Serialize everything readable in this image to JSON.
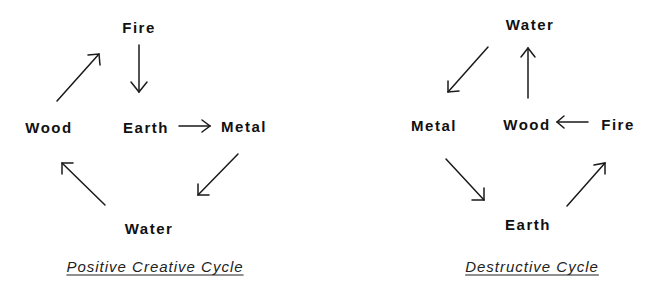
{
  "creative_cycle": {
    "caption": "Positive Creative Cycle",
    "nodes": {
      "fire": "Fire",
      "earth": "Earth",
      "metal": "Metal",
      "water": "Water",
      "wood": "Wood"
    },
    "edges": [
      {
        "from": "Fire",
        "to": "Earth"
      },
      {
        "from": "Earth",
        "to": "Metal"
      },
      {
        "from": "Metal",
        "to": "Water"
      },
      {
        "from": "Water",
        "to": "Wood"
      },
      {
        "from": "Wood",
        "to": "Fire"
      }
    ]
  },
  "destructive_cycle": {
    "caption": "Destructive Cycle",
    "nodes": {
      "water": "Water",
      "metal": "Metal",
      "wood": "Wood",
      "fire": "Fire",
      "earth": "Earth"
    },
    "edges": [
      {
        "from": "Water",
        "to": "Metal"
      },
      {
        "from": "Metal",
        "to": "Earth"
      },
      {
        "from": "Earth",
        "to": "Fire"
      },
      {
        "from": "Fire",
        "to": "Wood"
      },
      {
        "from": "Wood",
        "to": "Water"
      }
    ]
  },
  "colors": {
    "ink": "#111111",
    "background": "#ffffff"
  }
}
